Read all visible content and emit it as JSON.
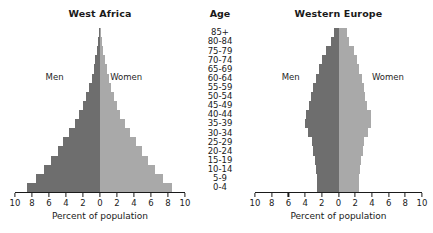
{
  "chart_data": {
    "type": "bar",
    "subtype": "population-pyramid",
    "title": "",
    "age_header": "Age",
    "categories": [
      "0-4",
      "5-9",
      "10-14",
      "15-19",
      "20-24",
      "25-29",
      "30-34",
      "35-39",
      "40-44",
      "45-49",
      "50-54",
      "55-59",
      "60-64",
      "65-69",
      "70-74",
      "75-79",
      "80-84",
      "85+"
    ],
    "xlabel": "Percent of population",
    "ylabel": "Age",
    "xlim": [
      -10,
      10
    ],
    "xticks": [
      10,
      8,
      6,
      4,
      2,
      0,
      2,
      4,
      6,
      8,
      10
    ],
    "grid": false,
    "legend_position": "inline-annotation",
    "legend_entries": [
      "Men",
      "Women"
    ],
    "colors": {
      "men": "#6e6e6e",
      "women": "#a9a9a9",
      "axis": "#1a1a1a",
      "background": "#ffffff"
    },
    "panels": [
      {
        "title": "West Africa",
        "men_label": "Men",
        "women_label": "Women",
        "series": [
          {
            "name": "Men",
            "values": [
              8.6,
              7.5,
              6.6,
              5.8,
              5.0,
              4.3,
              3.6,
              3.0,
              2.5,
              2.0,
              1.6,
              1.3,
              1.0,
              0.75,
              0.55,
              0.35,
              0.2,
              0.1
            ]
          },
          {
            "name": "Women",
            "values": [
              8.5,
              7.4,
              6.5,
              5.7,
              4.9,
              4.2,
              3.5,
              2.9,
              2.4,
              2.0,
              1.6,
              1.3,
              1.0,
              0.8,
              0.6,
              0.4,
              0.22,
              0.12
            ]
          }
        ]
      },
      {
        "title": "Western Europe",
        "men_label": "Men",
        "women_label": "Women",
        "series": [
          {
            "name": "Men",
            "values": [
              2.55,
              2.6,
              2.75,
              2.85,
              3.0,
              3.2,
              3.6,
              4.0,
              3.95,
              3.5,
              3.25,
              3.0,
              2.75,
              2.35,
              1.95,
              1.5,
              0.85,
              0.5
            ]
          },
          {
            "name": "Women",
            "values": [
              2.45,
              2.5,
              2.6,
              2.7,
              2.9,
              3.1,
              3.5,
              3.9,
              3.85,
              3.45,
              3.2,
              3.0,
              2.8,
              2.5,
              2.2,
              1.85,
              1.25,
              1.0
            ]
          }
        ]
      }
    ]
  }
}
